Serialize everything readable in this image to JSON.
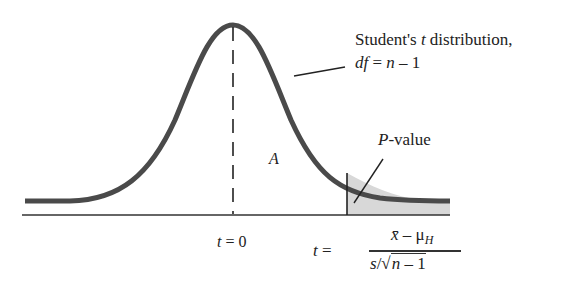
{
  "diagram": {
    "title_line1_prefix": "Student's ",
    "title_line1_var": "t",
    "title_line1_suffix": " distribution,",
    "title_line2_var": "df",
    "title_line2_rest": " = ",
    "title_line2_n": "n",
    "title_line2_tail": " – 1",
    "region_label": "A",
    "pvalue_var": "P",
    "pvalue_suffix": "-value",
    "center_label_var": "t",
    "center_label_rest": " = 0",
    "formula": {
      "lhs_var": "t",
      "lhs_eq": " = ",
      "num_xbar": "x̄",
      "num_minus": " – ",
      "num_mu": "μ",
      "num_sub": "H",
      "den_s": "s",
      "den_slash": "/",
      "den_radical": "√",
      "den_n": "n",
      "den_tail": " – 1"
    },
    "colors": {
      "curve": "#4a4a4a",
      "shade": "#d6d6d6",
      "axis": "#333333"
    }
  }
}
